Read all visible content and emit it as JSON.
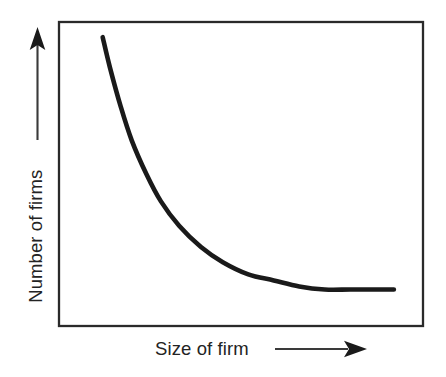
{
  "figure": {
    "background_color": "#ffffff",
    "ink_color": "#232323",
    "curve_color": "#1a1a1a",
    "frame_color": "#2a2a2a"
  },
  "axes": {
    "y": {
      "label": "Number of firms",
      "arrow": "up-arrow-icon",
      "arrow_direction": "up"
    },
    "x": {
      "label": "Size of firm",
      "arrow": "right-arrow-icon",
      "arrow_direction": "right"
    }
  },
  "chart_data": {
    "type": "line",
    "title": "",
    "subtitle": "",
    "xlabel": "Size of firm",
    "ylabel": "Number of firms",
    "grid": false,
    "legend": null,
    "legend_position": "none",
    "axis_ticks": false,
    "tick_labels": {
      "x": [],
      "y": []
    },
    "xlim": [
      0,
      100
    ],
    "ylim": [
      0,
      100
    ],
    "annotations": [],
    "series": [
      {
        "name": "Firm size distribution",
        "color": "#1a1a1a",
        "line_width": 4.6,
        "x": [
          12,
          14,
          17,
          20,
          24,
          28,
          33,
          39,
          45,
          52,
          59,
          66,
          73,
          80,
          87,
          92
        ],
        "y": [
          95,
          85,
          72,
          61,
          50,
          41,
          33,
          26,
          21,
          17,
          15,
          13,
          12,
          12,
          12,
          12
        ]
      }
    ]
  }
}
